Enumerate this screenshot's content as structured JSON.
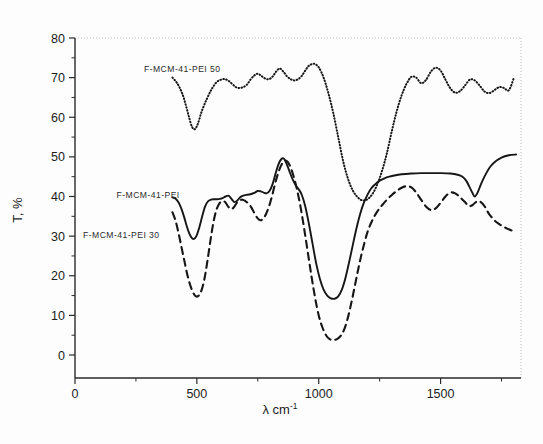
{
  "figure": {
    "title": "",
    "background_color": "#fdfdfd",
    "line_color": "#161616"
  },
  "axes": {
    "x_title_symbol": "λ cm",
    "x_title_exponent": "-1",
    "y_title": "T, %",
    "x_ticks": [
      "0",
      "500",
      "1000",
      "1500"
    ],
    "y_ticks": [
      "0",
      "10",
      "20",
      "30",
      "40",
      "50",
      "60",
      "70",
      "80"
    ]
  },
  "series_labels": {
    "pei50": "F-MCM-41-PEI 50",
    "pei": "F-MCM-41-PEI",
    "pei30": "F-MCM-41-PEI 30"
  },
  "chart_data": {
    "type": "line",
    "title": "",
    "xlabel": "λ cm-1",
    "ylabel": "T, %",
    "xlim": [
      0,
      1830
    ],
    "ylim": [
      0,
      80
    ],
    "xticks": [
      0,
      500,
      1000,
      1500
    ],
    "xticks_minor": [
      250,
      750,
      1250,
      1750
    ],
    "yticks": [
      0,
      10,
      20,
      30,
      40,
      50,
      60,
      70,
      80
    ],
    "yticks_minor": [
      5,
      15,
      25,
      35,
      45,
      55,
      65,
      75
    ],
    "grid": false,
    "legend": "inline-annotations",
    "series": [
      {
        "name": "F-MCM-41-PEI 50",
        "style": "dotted",
        "label_x": 440,
        "label_y": 71.5,
        "x": [
          400,
          420,
          440,
          455,
          468,
          480,
          492,
          505,
          520,
          540,
          560,
          580,
          600,
          615,
          630,
          645,
          660,
          675,
          690,
          705,
          720,
          735,
          750,
          765,
          780,
          795,
          810,
          825,
          840,
          855,
          870,
          885,
          900,
          915,
          930,
          945,
          960,
          980,
          1000,
          1020,
          1040,
          1060,
          1080,
          1100,
          1120,
          1140,
          1160,
          1180,
          1200,
          1220,
          1240,
          1260,
          1280,
          1300,
          1320,
          1340,
          1360,
          1380,
          1400,
          1420,
          1440,
          1460,
          1480,
          1500,
          1520,
          1540,
          1560,
          1580,
          1600,
          1620,
          1640,
          1660,
          1680,
          1700,
          1720,
          1740,
          1760,
          1780,
          1800
        ],
        "y": [
          70.0,
          68.5,
          66.0,
          63.0,
          60.0,
          57.6,
          57.0,
          58.5,
          61.5,
          64.5,
          67.0,
          68.8,
          69.5,
          69.6,
          69.2,
          68.4,
          67.6,
          67.4,
          67.6,
          68.2,
          69.5,
          70.5,
          71.0,
          70.4,
          69.8,
          69.6,
          70.2,
          71.5,
          72.3,
          71.5,
          70.3,
          69.6,
          69.3,
          69.6,
          70.4,
          71.8,
          73.0,
          73.5,
          72.6,
          70.0,
          66.0,
          61.0,
          55.0,
          49.0,
          44.5,
          41.5,
          39.8,
          39.0,
          39.3,
          40.6,
          43.0,
          46.5,
          51.0,
          56.5,
          61.5,
          65.5,
          68.4,
          70.2,
          70.0,
          68.6,
          69.4,
          71.5,
          72.5,
          71.8,
          69.5,
          67.3,
          66.2,
          66.6,
          68.0,
          69.5,
          69.3,
          68.0,
          66.5,
          66.1,
          66.8,
          67.6,
          67.4,
          66.8,
          69.8
        ]
      },
      {
        "name": "F-MCM-41-PEI",
        "style": "solid",
        "label_x": 300,
        "label_y": 39.5,
        "x": [
          400,
          412,
          424,
          436,
          448,
          458,
          468,
          478,
          488,
          498,
          510,
          522,
          534,
          546,
          558,
          570,
          582,
          594,
          606,
          618,
          630,
          642,
          654,
          666,
          678,
          690,
          702,
          714,
          726,
          738,
          750,
          762,
          774,
          786,
          798,
          810,
          822,
          834,
          846,
          858,
          870,
          882,
          894,
          906,
          918,
          930,
          945,
          960,
          975,
          990,
          1005,
          1020,
          1035,
          1050,
          1065,
          1080,
          1095,
          1110,
          1125,
          1140,
          1155,
          1170,
          1185,
          1200,
          1215,
          1230,
          1250,
          1270,
          1290,
          1310,
          1340,
          1380,
          1420,
          1460,
          1500,
          1540,
          1570,
          1590,
          1605,
          1618,
          1630,
          1640,
          1652,
          1665,
          1680,
          1700,
          1720,
          1750,
          1780,
          1810
        ],
        "y": [
          39.8,
          39.5,
          38.6,
          37.0,
          34.8,
          32.6,
          30.8,
          29.6,
          29.3,
          30.0,
          32.2,
          35.0,
          37.5,
          38.8,
          39.2,
          39.3,
          39.3,
          39.4,
          39.6,
          40.0,
          40.2,
          39.4,
          38.6,
          39.0,
          39.8,
          40.2,
          40.4,
          40.5,
          40.7,
          41.0,
          41.4,
          41.3,
          41.0,
          40.8,
          41.4,
          43.0,
          45.6,
          48.0,
          49.4,
          49.5,
          48.0,
          46.0,
          44.2,
          42.8,
          41.8,
          40.5,
          37.5,
          33.0,
          28.0,
          23.0,
          19.2,
          16.5,
          15.0,
          14.3,
          14.2,
          14.8,
          16.5,
          19.5,
          23.5,
          27.8,
          32.0,
          35.6,
          38.4,
          40.4,
          42.0,
          43.0,
          44.0,
          44.6,
          45.0,
          45.3,
          45.6,
          45.8,
          45.9,
          45.9,
          45.9,
          45.8,
          45.5,
          45.0,
          44.0,
          42.5,
          41.0,
          40.0,
          41.0,
          43.0,
          45.0,
          47.2,
          48.6,
          49.8,
          50.4,
          50.6
        ]
      },
      {
        "name": "F-MCM-41-PEI 30",
        "style": "dashed",
        "label_x": 190,
        "label_y": 29.5,
        "x": [
          400,
          412,
          424,
          436,
          448,
          460,
          472,
          484,
          496,
          508,
          520,
          532,
          544,
          556,
          568,
          580,
          592,
          604,
          616,
          628,
          640,
          652,
          664,
          676,
          688,
          700,
          712,
          724,
          736,
          748,
          760,
          772,
          784,
          796,
          808,
          820,
          832,
          844,
          856,
          868,
          880,
          895,
          910,
          925,
          940,
          955,
          970,
          985,
          1000,
          1015,
          1030,
          1045,
          1060,
          1075,
          1090,
          1105,
          1120,
          1135,
          1150,
          1165,
          1180,
          1200,
          1220,
          1240,
          1260,
          1280,
          1300,
          1320,
          1340,
          1360,
          1380,
          1400,
          1420,
          1440,
          1460,
          1480,
          1500,
          1520,
          1540,
          1560,
          1580,
          1600,
          1615,
          1630,
          1645,
          1660,
          1680,
          1700,
          1730,
          1770,
          1810
        ],
        "y": [
          36.0,
          34.0,
          31.0,
          27.5,
          24.0,
          20.5,
          17.8,
          15.8,
          14.8,
          15.0,
          16.5,
          19.5,
          24.0,
          29.0,
          33.5,
          36.6,
          38.2,
          38.8,
          38.6,
          37.5,
          36.8,
          37.3,
          38.4,
          39.0,
          39.2,
          38.8,
          38.2,
          37.2,
          35.8,
          34.6,
          34.0,
          34.4,
          35.6,
          37.5,
          40.0,
          43.0,
          45.6,
          47.6,
          48.8,
          49.0,
          48.0,
          45.5,
          42.0,
          37.5,
          32.0,
          26.0,
          20.0,
          14.5,
          10.0,
          7.0,
          5.0,
          4.0,
          3.8,
          4.0,
          4.8,
          6.5,
          9.5,
          13.5,
          18.0,
          22.5,
          26.5,
          31.0,
          34.0,
          36.2,
          37.8,
          39.2,
          40.4,
          41.4,
          42.2,
          42.6,
          42.3,
          41.0,
          39.2,
          37.5,
          36.6,
          37.0,
          38.4,
          40.0,
          41.0,
          40.8,
          39.8,
          38.6,
          37.6,
          37.8,
          38.6,
          38.8,
          37.6,
          35.5,
          33.5,
          32.0,
          31.0
        ]
      }
    ]
  }
}
